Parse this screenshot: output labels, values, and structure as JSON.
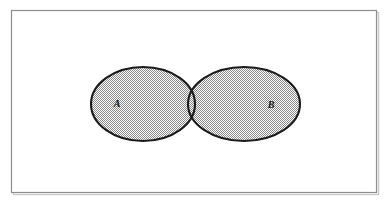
{
  "figure": {
    "kind": "venn-diagram",
    "title": "",
    "caption": "",
    "background_color": "#ffffff",
    "frame": {
      "name": "figure-border",
      "x": 11,
      "y": 10,
      "width": 365,
      "height": 182,
      "stroke_color": "#8d8d8d",
      "stroke_width": 1.2,
      "fill_color": "#ffffff"
    },
    "shadow": {
      "color": "#c9c9c9",
      "offset_x": 2,
      "offset_y": 2
    },
    "fill": {
      "pattern": "50-percent-checkerboard-dither",
      "light_color": "#ffffff",
      "dark_color": "#8a8a8a",
      "effective_gray": "#c3c3c3",
      "cell_size": 2
    },
    "stroke": {
      "color": "#1a1a1a",
      "width": 2.1
    },
    "sets": [
      {
        "id": "set-a",
        "label": "A",
        "label_x": 117,
        "label_y": 107,
        "cx": 143,
        "cy": 104,
        "rx": 52,
        "ry": 37
      },
      {
        "id": "set-b",
        "label": "B",
        "label_x": 271,
        "label_y": 108,
        "cx": 244,
        "cy": 104,
        "rx": 56,
        "ry": 37
      }
    ],
    "intersection": {
      "id": "set-a-intersect-b",
      "label": "",
      "shaded": true
    }
  }
}
